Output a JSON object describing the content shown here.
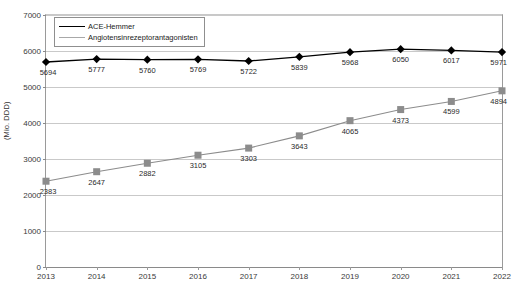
{
  "chart_data": {
    "type": "line",
    "title": "",
    "xlabel": "",
    "ylabel": "(Mio. DDD)",
    "categories": [
      "2013",
      "2014",
      "2015",
      "2016",
      "2017",
      "2018",
      "2019",
      "2020",
      "2021",
      "2022"
    ],
    "x": [
      2013,
      2014,
      2015,
      2016,
      2017,
      2018,
      2019,
      2020,
      2021,
      2022
    ],
    "ylim": [
      0,
      7000
    ],
    "ytick_values": [
      0,
      1000,
      2000,
      3000,
      4000,
      5000,
      6000,
      7000
    ],
    "ytick_labels": [
      "0",
      "1000",
      "2000",
      "3000",
      "4000",
      "5000",
      "6000",
      "7000"
    ],
    "grid": true,
    "legend_position": "top-left",
    "series": [
      {
        "name": "ACE-Hemmer",
        "marker": "diamond",
        "color": "#000000",
        "values": [
          5694,
          5777,
          5760,
          5769,
          5722,
          5839,
          5968,
          6050,
          6017,
          5971
        ],
        "labels": [
          "5694",
          "5777",
          "5760",
          "5769",
          "5722",
          "5839",
          "5968",
          "6050",
          "6017",
          "5971"
        ]
      },
      {
        "name": "Angiotensinrezeptorantagonisten",
        "marker": "square",
        "color": "#8c8c8c",
        "values": [
          2383,
          2647,
          2882,
          3105,
          3303,
          3643,
          4065,
          4373,
          4599,
          4894
        ],
        "labels": [
          "2383",
          "2647",
          "2882",
          "3105",
          "3303",
          "3643",
          "4065",
          "4373",
          "4599",
          "4894"
        ]
      }
    ]
  },
  "legend": {
    "items": [
      {
        "label": "ACE-Hemmer"
      },
      {
        "label": "Angiotensinrezeptorantagonisten"
      }
    ]
  },
  "axis": {
    "y_title": "(Mio. DDD)"
  }
}
